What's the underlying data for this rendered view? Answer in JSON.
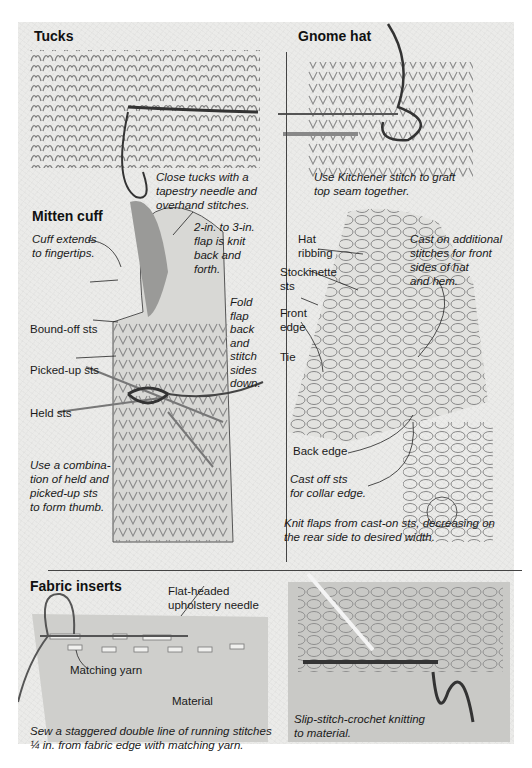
{
  "sections": {
    "tucks": {
      "heading": "Tucks",
      "caption_lines": [
        "Close tucks with a",
        "tapestry needle and",
        "overhand stitches."
      ]
    },
    "mitten_cuff": {
      "heading": "Mitten cuff",
      "labels": {
        "cuff_extends": [
          "Cuff extends",
          "to fingertips."
        ],
        "flap": [
          "2-in. to 3-in.",
          "flap is knit",
          "back and",
          "forth."
        ],
        "fold_flap": [
          "Fold",
          "flap",
          "back",
          "and",
          "stitch",
          "sides",
          "down."
        ],
        "bound_off": "Bound-off sts",
        "picked_up": "Picked-up sts",
        "held": "Held sts"
      },
      "caption_lines": [
        "Use a combina-",
        "tion of held and",
        "picked-up sts",
        "to form thumb."
      ]
    },
    "gnome_hat": {
      "heading": "Gnome hat",
      "caption_lines": [
        "Use Kitchener stitch to graft",
        "top seam together."
      ],
      "labels": {
        "hat_ribbing": [
          "Hat",
          "ribbing"
        ],
        "stockinette": [
          "Stockinette",
          "sts"
        ],
        "front_edge": [
          "Front",
          "edge"
        ],
        "tie": "Tie",
        "cast_on": [
          "Cast on additional",
          "stitches for front",
          "sides of hat",
          "and hem."
        ],
        "back_edge": "Back edge",
        "cast_off": [
          "Cast off sts",
          "for collar edge."
        ]
      },
      "bottom_caption_lines": [
        "Knit flaps from cast-on sts, decreasing on",
        "the rear side to desired width."
      ]
    },
    "fabric_inserts": {
      "heading": "Fabric inserts",
      "labels": {
        "needle": [
          "Flat-headed",
          "upholstery needle"
        ],
        "yarn": "Matching yarn",
        "material": "Material"
      },
      "caption_lines": [
        "Sew a staggered double line of running stitches",
        "¼ in. from fabric edge with matching yarn."
      ]
    },
    "crochet": {
      "caption_lines": [
        "Slip-stitch-crochet knitting",
        "to material."
      ]
    }
  }
}
